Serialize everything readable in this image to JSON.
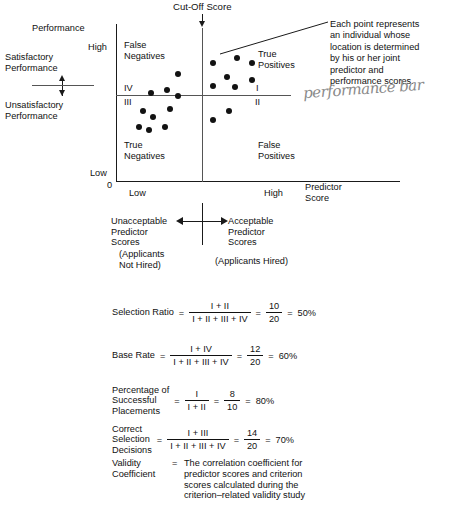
{
  "figure": {
    "title_top": "Cut-Off Score",
    "annotation": "Each point represents\nan individual whose\nlocation is determined\nby his or her joint\npredictor and\nperformance scores.",
    "handwritten_note": "performance bar"
  },
  "axes": {
    "y_axis_title": "Performance",
    "y_high": "High",
    "y_low": "Low",
    "origin": "0",
    "x_low": "Low",
    "x_high": "High",
    "x_axis_title": "Predictor\nScore"
  },
  "performance_bracket": {
    "satisfactory": "Satisfactory\nPerformance",
    "unsatisfactory": "Unsatisfactory\nPerformance"
  },
  "quadrants": {
    "top_left_label": "False\nNegatives",
    "top_right_label": "True\nPositives",
    "bottom_left_label": "True\nNegatives",
    "bottom_right_label": "False\nPositives",
    "roman_iv": "IV",
    "roman_iii": "III",
    "roman_i": "I",
    "roman_ii": "II"
  },
  "predictor_bands": {
    "left_label": "Unacceptable\nPredictor\nScores",
    "right_label": "Acceptable\nPredictor\nScores",
    "left_sub": "(Applicants\nNot Hired)",
    "right_sub": "(Applicants Hired)"
  },
  "formulas": [
    {
      "name": "selection-ratio",
      "label": "Selection Ratio",
      "numerator": "I + II",
      "denominator": "I + II + III + IV",
      "value_num": "10",
      "value_den": "20",
      "result": "50%"
    },
    {
      "name": "base-rate",
      "label": "Base Rate",
      "numerator": "I + IV",
      "denominator": "I + II + III + IV",
      "value_num": "12",
      "value_den": "20",
      "result": "60%"
    },
    {
      "name": "percentage-successful-placements",
      "label": "Percentage of\nSuccessful\nPlacements",
      "numerator": "I",
      "denominator": "I + II",
      "value_num": "8",
      "value_den": "10",
      "result": "80%"
    },
    {
      "name": "correct-selection-decisions",
      "label": "Correct\nSelection\nDecisions",
      "numerator": "I + III",
      "denominator": "I + II + III + IV",
      "value_num": "14",
      "value_den": "20",
      "result": "70%"
    }
  ],
  "validity": {
    "label": "Validity\nCoefficient",
    "equals": "=",
    "definition": "The correlation coefficient for\npredictor scores and criterion\nscores calculated during the\ncriterion–related validity study"
  },
  "chart_data": {
    "type": "scatter",
    "title": "Cut-Off Score",
    "xlabel": "Predictor Score",
    "ylabel": "Performance",
    "xlim": [
      0,
      100
    ],
    "ylim": [
      0,
      100
    ],
    "grid": false,
    "legend": "none",
    "cutoff_x": 50,
    "performance_line_y": 50,
    "xtick_labels": [
      "Low",
      "High"
    ],
    "ytick_labels": [
      "Low",
      "High"
    ],
    "n_points": 20,
    "quadrant_counts": {
      "I_true_positives": 8,
      "II_false_positives": 2,
      "III_true_negatives": 7,
      "IV_false_negatives": 3
    },
    "points": [
      {
        "x": 35.6,
        "y": 70.0,
        "quadrant": "IV"
      },
      {
        "x": 20.0,
        "y": 57.5,
        "quadrant": "IV"
      },
      {
        "x": 28.9,
        "y": 59.4,
        "quadrant": "IV"
      },
      {
        "x": 35.6,
        "y": 55.6,
        "quadrant": "IV"
      },
      {
        "x": 15.6,
        "y": 45.6,
        "quadrant": "III"
      },
      {
        "x": 21.1,
        "y": 41.9,
        "quadrant": "III"
      },
      {
        "x": 31.1,
        "y": 46.9,
        "quadrant": "III"
      },
      {
        "x": 13.3,
        "y": 35.6,
        "quadrant": "III"
      },
      {
        "x": 18.9,
        "y": 33.1,
        "quadrant": "III"
      },
      {
        "x": 27.8,
        "y": 35.6,
        "quadrant": "III"
      },
      {
        "x": 55.6,
        "y": 76.9,
        "quadrant": "I"
      },
      {
        "x": 68.9,
        "y": 80.6,
        "quadrant": "I"
      },
      {
        "x": 77.8,
        "y": 76.9,
        "quadrant": "I"
      },
      {
        "x": 63.3,
        "y": 68.1,
        "quadrant": "I"
      },
      {
        "x": 77.8,
        "y": 66.3,
        "quadrant": "I"
      },
      {
        "x": 55.6,
        "y": 61.9,
        "quadrant": "I"
      },
      {
        "x": 67.8,
        "y": 61.3,
        "quadrant": "I"
      },
      {
        "x": 64.4,
        "y": 45.6,
        "quadrant": "II"
      },
      {
        "x": 55.6,
        "y": 40.0,
        "quadrant": "II"
      }
    ]
  }
}
